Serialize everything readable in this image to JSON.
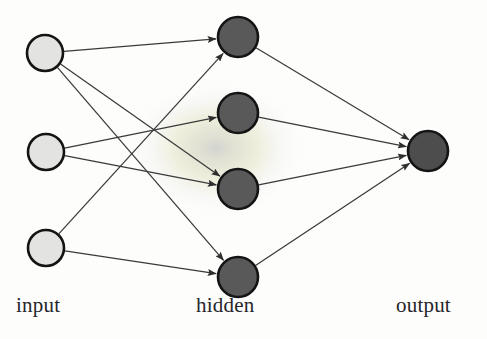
{
  "figure": {
    "background_color": "#fdfdfc",
    "width": 487,
    "height": 339
  },
  "labels": {
    "input": "input",
    "hidden": "hidden",
    "output": "output"
  },
  "colors": {
    "input_node_fill": "#e3e3e1",
    "hidden_node_fill": "#595959",
    "output_node_fill": "#4d4d4d",
    "node_stroke": "#141414",
    "edge_stroke": "#3a3a3a",
    "label_text": "#26262a",
    "smudge": "#d8d8d6"
  },
  "chart_data": {
    "type": "diagram",
    "diagram_kind": "neural-network",
    "layers": [
      {
        "name": "input",
        "label": "input",
        "node_count": 3,
        "fill": "#e3e3e1",
        "radius": 18,
        "nodes": [
          {
            "id": "i1",
            "cx": 45,
            "cy": 53
          },
          {
            "id": "i2",
            "cx": 46,
            "cy": 152
          },
          {
            "id": "i3",
            "cx": 46,
            "cy": 248
          }
        ]
      },
      {
        "name": "hidden",
        "label": "hidden",
        "node_count": 4,
        "fill": "#595959",
        "radius": 20,
        "nodes": [
          {
            "id": "h1",
            "cx": 238,
            "cy": 37
          },
          {
            "id": "h2",
            "cx": 238,
            "cy": 113
          },
          {
            "id": "h3",
            "cx": 238,
            "cy": 189
          },
          {
            "id": "h4",
            "cx": 238,
            "cy": 277
          }
        ]
      },
      {
        "name": "output",
        "label": "output",
        "node_count": 1,
        "fill": "#4d4d4d",
        "radius": 20,
        "nodes": [
          {
            "id": "o1",
            "cx": 428,
            "cy": 151
          }
        ]
      }
    ],
    "edges": [
      {
        "from": "i1",
        "to": "h1",
        "arrow": true
      },
      {
        "from": "i1",
        "to": "h3",
        "arrow": true
      },
      {
        "from": "i1",
        "to": "h4",
        "arrow": true
      },
      {
        "from": "i2",
        "to": "h2",
        "arrow": true
      },
      {
        "from": "i2",
        "to": "h3",
        "arrow": true
      },
      {
        "from": "i3",
        "to": "h1",
        "arrow": true
      },
      {
        "from": "i3",
        "to": "h4",
        "arrow": true
      },
      {
        "from": "h1",
        "to": "o1",
        "arrow": true
      },
      {
        "from": "h2",
        "to": "o1",
        "arrow": true
      },
      {
        "from": "h3",
        "to": "o1",
        "arrow": true
      },
      {
        "from": "h4",
        "to": "o1",
        "arrow": true
      }
    ],
    "edge_count": 11,
    "node_count": 8
  }
}
